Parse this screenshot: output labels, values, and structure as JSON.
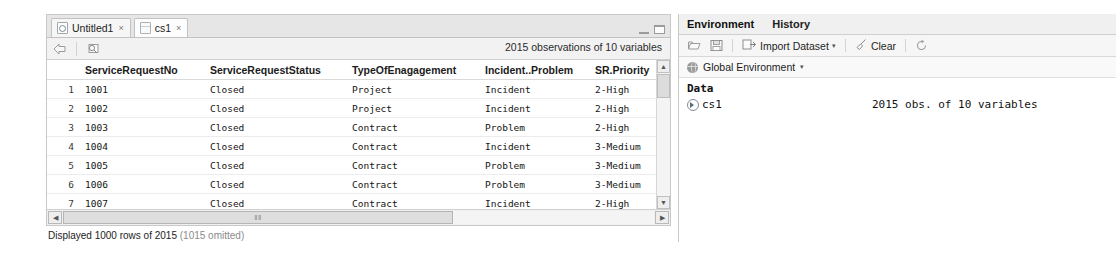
{
  "source_pane": {
    "tabs": [
      {
        "label": "Untitled1",
        "icon": "r-script-icon",
        "active": false,
        "close": "×"
      },
      {
        "label": "cs1",
        "icon": "data-table-icon",
        "active": true,
        "close": "×"
      }
    ],
    "window_controls": {
      "minimize": "minimize-icon",
      "maximize": "maximize-icon"
    },
    "toolbar": {
      "back_icon": "back-arrow-icon",
      "filter_icon": "filter-icon",
      "observations_label": "2015 observations of 10 variables"
    },
    "table": {
      "rownum_header": "",
      "columns": [
        "ServiceRequestNo",
        "ServiceRequestStatus",
        "TypeOfEnagagement",
        "Incident..Problem",
        "SR.Priority"
      ],
      "rows": [
        {
          "n": "1",
          "cells": [
            "1001",
            "Closed",
            "Project",
            "Incident",
            "2-High"
          ]
        },
        {
          "n": "2",
          "cells": [
            "1002",
            "Closed",
            "Project",
            "Incident",
            "2-High"
          ]
        },
        {
          "n": "3",
          "cells": [
            "1003",
            "Closed",
            "Contract",
            "Problem",
            "2-High"
          ]
        },
        {
          "n": "4",
          "cells": [
            "1004",
            "Closed",
            "Contract",
            "Incident",
            "3-Medium"
          ]
        },
        {
          "n": "5",
          "cells": [
            "1005",
            "Closed",
            "Contract",
            "Problem",
            "3-Medium"
          ]
        },
        {
          "n": "6",
          "cells": [
            "1006",
            "Closed",
            "Contract",
            "Problem",
            "3-Medium"
          ]
        },
        {
          "n": "7",
          "cells": [
            "1007",
            "Closed",
            "Contract",
            "Incident",
            "2-High"
          ]
        }
      ],
      "scroll_up_icon": "▲",
      "scroll_down_icon": "▼",
      "scroll_left_icon": "◀",
      "scroll_right_icon": "▶",
      "hthumb_grip": "‖‖"
    },
    "status": {
      "text": "Displayed 1000 rows of 2015",
      "omitted": "(1015 omitted)"
    }
  },
  "env_pane": {
    "tabs": [
      {
        "label": "Environment",
        "active": true
      },
      {
        "label": "History",
        "active": false
      }
    ],
    "toolbar": {
      "load_icon": "load-workspace-icon",
      "save_icon": "save-workspace-icon",
      "import_icon": "import-dataset-icon",
      "import_label": "Import Dataset",
      "import_caret": "▾",
      "clear_icon": "broom-icon",
      "clear_label": "Clear",
      "refresh_icon": "refresh-icon"
    },
    "scope": {
      "icon": "globe-icon",
      "label": "Global Environment",
      "caret": "▾"
    },
    "data_section": {
      "title": "Data",
      "items": [
        {
          "expand_icon": "expand-triangle-icon",
          "name": "cs1",
          "description": "2015 obs. of 10 variables"
        }
      ]
    }
  }
}
